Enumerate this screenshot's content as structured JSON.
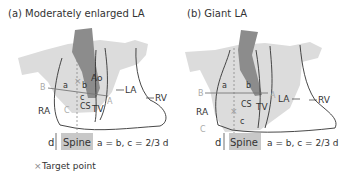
{
  "panels": [
    {
      "title": "(a) Moderately enlarged LA",
      "labels": {
        "ao": "Ao",
        "la": "LA",
        "rv": "RV",
        "ra": "RA",
        "tv": "TV",
        "cs": "CS",
        "a": "a",
        "b": "b",
        "c": "c",
        "B": "B",
        "A": "A",
        "C": "C",
        "d": "d",
        "spine": "Spine"
      },
      "formula": "a = b, c = 2/3 d"
    },
    {
      "title": "(b) Giant LA",
      "labels": {
        "la": "LA",
        "rv": "RV",
        "ra": "RA",
        "tv": "TV",
        "cs": "CS",
        "a": "a",
        "b": "b",
        "c": "c",
        "B": "B",
        "A": "A",
        "C": "C",
        "d": "d",
        "spine": "Spine"
      },
      "formula": "a = b, c = 2/3 d"
    }
  ],
  "legend": {
    "symbol": "×",
    "label": "Target point"
  },
  "colors": {
    "la_fill": "#dcdcdc",
    "aorta": "#8c8c8c",
    "spine": "#c8c8c8",
    "outline": "#333333",
    "faint": "#aaaaaa"
  }
}
